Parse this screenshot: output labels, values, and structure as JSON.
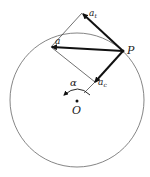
{
  "diagram": {
    "labels": {
      "tangential": "a",
      "tangential_sub": "t",
      "total": "a",
      "centripetal": "a",
      "centripetal_sub": "c",
      "point": "P",
      "origin": "O",
      "angular_accel": "α"
    },
    "colors": {
      "line": "#333333",
      "thick_line": "#111111",
      "circle": "#666666"
    }
  }
}
